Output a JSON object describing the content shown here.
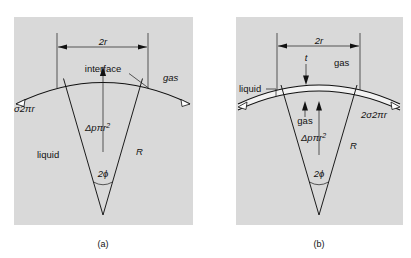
{
  "figure": {
    "type": "diagram",
    "background": "#ffffff",
    "plate_fill": "#d9d9d9",
    "line_color": "#111111"
  },
  "panel_a": {
    "caption": "(a)",
    "box": {
      "x": 14,
      "y": 17,
      "width": 179,
      "height": 208
    },
    "labels": {
      "diameter": "2r",
      "interface": "interface",
      "gas": "gas",
      "surface_tension": "σ2πr",
      "liquid": "liquid",
      "pressure_force": "Δpπr",
      "pressure_force_exp": "2",
      "radius": "R",
      "half_angle": "2ϕ"
    }
  },
  "panel_b": {
    "caption": "(b)",
    "box": {
      "x": 236,
      "y": 17,
      "width": 167,
      "height": 208
    },
    "labels": {
      "diameter": "2r",
      "thickness": "t",
      "gas_top": "gas",
      "liquid": "liquid",
      "gas_inner": "gas",
      "surface_tension": "2σ2πr",
      "pressure_force": "Δpπr",
      "pressure_force_exp": "2",
      "radius": "R",
      "half_angle": "2ϕ"
    }
  }
}
